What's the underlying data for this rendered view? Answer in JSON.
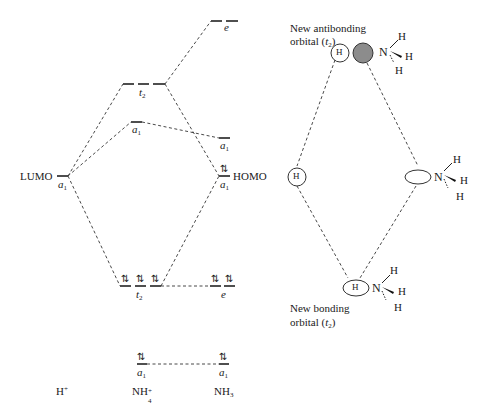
{
  "diagram": {
    "columns": {
      "left": "H⁺",
      "middle": "NH₄⁺",
      "right": "NH₃"
    },
    "column_labels": {
      "h_plus": {
        "base": "H",
        "sup": "+"
      },
      "nh4": {
        "base": "NH",
        "sub": "4",
        "sup": "+"
      },
      "nh3": {
        "base": "NH",
        "sub": "3"
      }
    },
    "levels": {
      "h_a1": {
        "sym": "a",
        "idx": "1",
        "tag": "LUMO",
        "electrons": ""
      },
      "nh4_e_top": {
        "sym": "e",
        "idx": ""
      },
      "nh4_t2_antibonding": {
        "sym": "t",
        "idx": "2"
      },
      "nh4_a1_upper": {
        "sym": "a",
        "idx": "1"
      },
      "nh3_a1_upper": {
        "sym": "a",
        "idx": "1"
      },
      "nh3_a1_homo": {
        "sym": "a",
        "idx": "1",
        "tag": "HOMO",
        "electrons": "⇅"
      },
      "nh4_t2_bonding": {
        "sym": "t",
        "idx": "2",
        "electrons": [
          "⇅",
          "⇅",
          "⇅"
        ]
      },
      "nh3_e": {
        "sym": "e",
        "idx": "",
        "electrons": [
          "⇅",
          "⇅"
        ]
      },
      "nh4_a1_low": {
        "sym": "a",
        "idx": "1",
        "electrons": "⇅"
      },
      "nh3_a1_low": {
        "sym": "a",
        "idx": "1",
        "electrons": "⇅"
      }
    },
    "orbital_pictures": {
      "antibonding_label_line1": "New antibonding",
      "antibonding_label_line2": "orbital (",
      "antibonding_sym": "t",
      "antibonding_idx": "2",
      "bonding_label_line1": "New bonding",
      "bonding_label_line2": "orbital (",
      "bonding_sym": "t",
      "bonding_idx": "2",
      "close_paren": ")",
      "h_atom": "H",
      "n_atom": "N",
      "shaded_lobe_color": "#8c8c8c"
    },
    "spin_pair": "⇅"
  }
}
